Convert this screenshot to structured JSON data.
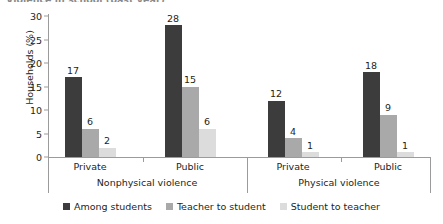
{
  "chart_data": {
    "type": "bar",
    "title": "",
    "xlabel": "",
    "ylabel": "Households (%)",
    "ylim": [
      0,
      30
    ],
    "yticks": [
      0,
      5,
      10,
      15,
      20,
      25,
      30
    ],
    "grid": false,
    "legend_position": "bottom",
    "categories": [
      "Private",
      "Public",
      "Private",
      "Public"
    ],
    "groups": [
      {
        "name": "Nonphysical violence",
        "categories": [
          "Private",
          "Public"
        ]
      },
      {
        "name": "Physical violence",
        "categories": [
          "Private",
          "Public"
        ]
      }
    ],
    "series": [
      {
        "name": "Among students",
        "color": "#3c3c3c",
        "values": [
          17,
          28,
          12,
          18
        ]
      },
      {
        "name": "Teacher to student",
        "color": "#a9a9a9",
        "values": [
          6,
          15,
          4,
          9
        ]
      },
      {
        "name": "Student to teacher",
        "color": "#dcdcdc",
        "values": [
          2,
          6,
          1,
          1
        ]
      }
    ],
    "axis_color": "#9b9b9b",
    "text_color": "#231f20"
  },
  "ylabel": "Households (%)",
  "yticks": [
    "30",
    "25",
    "20",
    "15",
    "10",
    "5",
    "0"
  ],
  "category_labels": [
    "Private",
    "Public",
    "Private",
    "Public"
  ],
  "group_labels": [
    "Nonphysical violence",
    "Physical violence"
  ],
  "legend": [
    {
      "label": "Among students",
      "color": "#3c3c3c"
    },
    {
      "label": "Teacher to student",
      "color": "#a9a9a9"
    },
    {
      "label": "Student to teacher",
      "color": "#dcdcdc"
    }
  ],
  "bar_values": [
    [
      "17",
      "6",
      "2"
    ],
    [
      "28",
      "15",
      "6"
    ],
    [
      "12",
      "4",
      "1"
    ],
    [
      "18",
      "9",
      "1"
    ]
  ],
  "title_remnant": "Violence in school (past year)"
}
